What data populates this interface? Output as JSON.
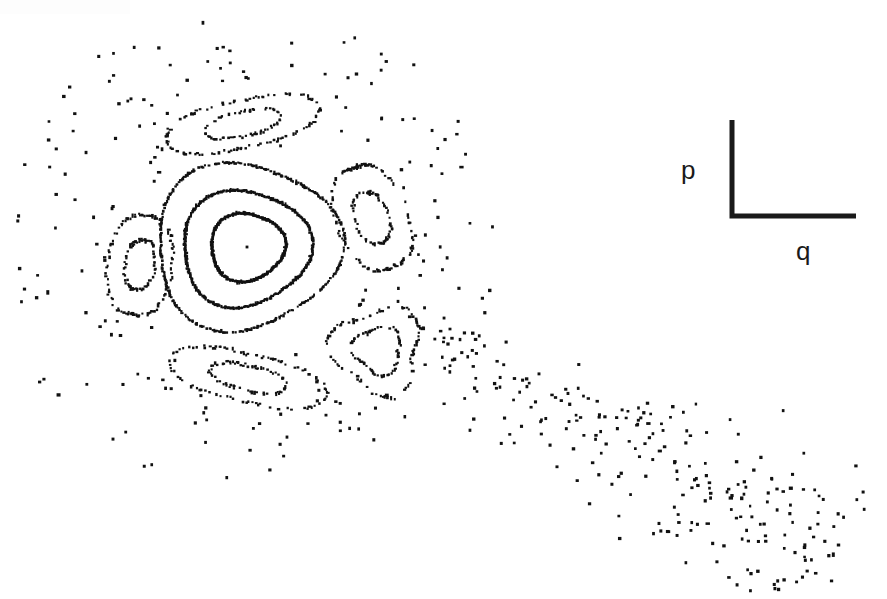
{
  "figure": {
    "type": "poincare-surface-of-section",
    "background_color": "#ffffff",
    "ink_color": "#111111",
    "width": 887,
    "height": 599
  },
  "axis_indicator": {
    "name": "axis-corner-marker",
    "shape": "L",
    "corner_x": 732,
    "corner_y": 216,
    "vertical_top_y": 120,
    "horizontal_right_x": 856,
    "line_width": 5,
    "color": "#1a1a1a",
    "vertical_label": "p",
    "horizontal_label": "q",
    "vertical_label_x": 681,
    "vertical_label_y": 157,
    "horizontal_label_x": 796,
    "horizontal_label_y": 238
  },
  "chart_data": {
    "type": "scatter",
    "title": "",
    "subtitle": "",
    "xlabel": "q",
    "ylabel": "p",
    "xlim": [
      0,
      887
    ],
    "ylim": [
      0,
      599
    ],
    "grid": false,
    "legend": "none",
    "annotations": [
      {
        "text": "p",
        "x": 690,
        "y": 175,
        "role": "momentum-axis-label"
      },
      {
        "text": "q",
        "x": 805,
        "y": 255,
        "role": "position-axis-label"
      }
    ],
    "center_fixed_point": {
      "x": 247,
      "y": 247
    },
    "series": [
      {
        "name": "invariant-curve-inner",
        "kind": "closed-curve",
        "center": [
          247,
          247
        ],
        "radius_x": 37,
        "radius_y": 34,
        "rotation_deg": -8,
        "lobe_amplitude": 0.055,
        "lobes": 3,
        "dash": "solid",
        "points": 260
      },
      {
        "name": "invariant-curve-middle",
        "kind": "closed-curve",
        "center": [
          245,
          248
        ],
        "radius_x": 64,
        "radius_y": 58,
        "rotation_deg": -6,
        "lobe_amplitude": 0.065,
        "lobes": 3,
        "dash": "solid",
        "points": 320
      },
      {
        "name": "invariant-curve-outer",
        "kind": "closed-curve",
        "center": [
          246,
          246
        ],
        "radius_x": 92,
        "radius_y": 83,
        "rotation_deg": -4,
        "lobe_amplitude": 0.075,
        "lobes": 3,
        "dash": "dashdot",
        "points": 380
      },
      {
        "name": "island-top-crescent",
        "kind": "island",
        "center": [
          243,
          124
        ],
        "radius_x": 64,
        "radius_y": 30,
        "rotation_deg": -12,
        "inner_scale": 0.5,
        "lobe_amplitude": 0.22,
        "lobes": 2,
        "dash": "dotted"
      },
      {
        "name": "island-left-teardrop",
        "kind": "island",
        "center": [
          140,
          265
        ],
        "radius_x": 27,
        "radius_y": 62,
        "rotation_deg": 8,
        "inner_scale": 0.48,
        "lobe_amplitude": 0.2,
        "lobes": 2,
        "dash": "dotted"
      },
      {
        "name": "island-right-elongated",
        "kind": "island",
        "center": [
          372,
          218
        ],
        "radius_x": 30,
        "radius_y": 66,
        "rotation_deg": -22,
        "inner_scale": 0.48,
        "lobe_amplitude": 0.2,
        "lobes": 2,
        "dash": "dotted"
      },
      {
        "name": "island-bottom-left-crescent",
        "kind": "island",
        "center": [
          248,
          378
        ],
        "radius_x": 66,
        "radius_y": 30,
        "rotation_deg": 13,
        "inner_scale": 0.5,
        "lobe_amplitude": 0.22,
        "lobes": 2,
        "dash": "dotted"
      },
      {
        "name": "island-bottom-right-triangle",
        "kind": "island",
        "center": [
          378,
          350
        ],
        "radius_x": 43,
        "radius_y": 42,
        "rotation_deg": 190,
        "inner_scale": 0.55,
        "lobe_amplitude": 0.2,
        "lobes": 3,
        "dash": "dotted"
      }
    ],
    "chaotic_sea": {
      "name": "chaotic-sea-scatter",
      "point_count": 430,
      "dot_size": 3,
      "halo_center": [
        250,
        250
      ],
      "halo_inner_radius": 110,
      "halo_outer_radius": 260,
      "plume_direction_deg": 28,
      "plume_length": 560,
      "plume_spread": 130,
      "seed": 20240917
    }
  }
}
